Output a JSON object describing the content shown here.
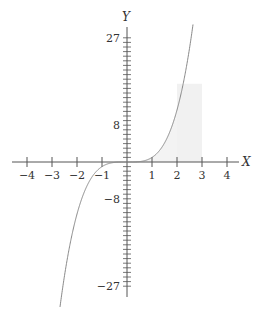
{
  "chart_data": {
    "type": "line",
    "title": "",
    "xlabel": "X",
    "ylabel": "Y",
    "x_ticks": [
      -4,
      -3,
      -2,
      -1,
      1,
      2,
      3,
      4
    ],
    "x_tick_labels": [
      "−4",
      "−3",
      "−2",
      "−1",
      "1",
      "2",
      "3",
      "4"
    ],
    "y_tick_labels": [
      {
        "value": 27,
        "label": "27"
      },
      {
        "value": 8,
        "label": "8"
      },
      {
        "value": -8,
        "label": "−8"
      },
      {
        "value": -27,
        "label": "−27"
      }
    ],
    "y_minor_tick_step": 1,
    "xlim": [
      -4.4,
      4.5
    ],
    "ylim": [
      -29,
      29
    ],
    "grid": false,
    "legend": null,
    "series": [
      {
        "name": "curve",
        "function": "sign(x)*|x|^3.5",
        "x_range": [
          -2.68,
          2.64
        ],
        "color": "#888888"
      }
    ],
    "shaded_regions": [
      {
        "type": "under-curve",
        "x_from": 0,
        "x_to": 2,
        "color": "#f3f3f3"
      },
      {
        "type": "rectangle",
        "x_from": 2,
        "x_to": 3,
        "y_from": 0,
        "y_to": 17,
        "color": "#f1f1f1"
      }
    ]
  },
  "style": {
    "axis_color": "#555555",
    "curve_color": "#888888",
    "shade_color": "#f2f2f2"
  },
  "labels": {
    "x_axis": "X",
    "y_axis": "Y"
  }
}
